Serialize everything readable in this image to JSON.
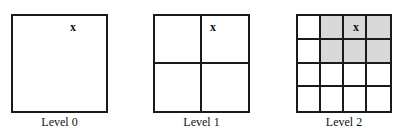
{
  "diagram": {
    "panels": [
      {
        "label": "Level 0",
        "divisions": 1,
        "shaded_cells": [],
        "marker": {
          "text": "x",
          "row": 0,
          "col": 0
        }
      },
      {
        "label": "Level 1",
        "divisions": 2,
        "shaded_cells": [],
        "marker": {
          "text": "x",
          "row": 0,
          "col": 1
        }
      },
      {
        "label": "Level 2",
        "divisions": 4,
        "shaded_cells": [
          [
            0,
            1
          ],
          [
            0,
            2
          ],
          [
            0,
            3
          ],
          [
            1,
            1
          ],
          [
            1,
            2
          ],
          [
            1,
            3
          ]
        ],
        "marker": {
          "text": "x",
          "row": 0,
          "col": 2
        }
      }
    ],
    "colors": {
      "line": "#1a1a1a",
      "shade": "#d9d9d9",
      "background": "#ffffff"
    }
  }
}
